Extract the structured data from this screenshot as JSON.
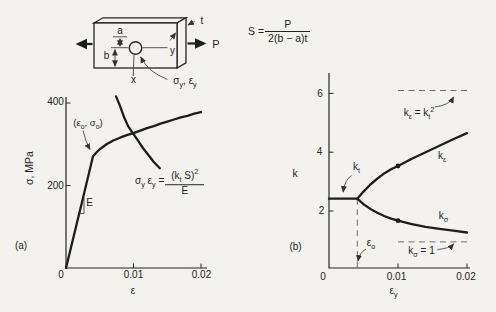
{
  "specimen": {
    "dim_a": "a",
    "dim_b": "b",
    "thickness": "t",
    "load": "P",
    "axis_x": "x",
    "axis_y": "y",
    "hole_stress": "σ_{y}, ε_{y}"
  },
  "equation": {
    "lhs": "S =",
    "numerator": "P",
    "denominator": "2(b − a)t"
  },
  "colors": {
    "background": "#f3f2ee",
    "ink": "#1d1d1d",
    "dashed_gray": "#6e6e6e"
  },
  "chart_data": [
    {
      "type": "line",
      "panel_label": "(a)",
      "xlabel": "ε",
      "ylabel": "σ, MPa",
      "xlim": [
        0,
        0.021
      ],
      "ylim": [
        0,
        430
      ],
      "x_ticks": [
        0,
        0.01,
        0.02
      ],
      "x_tick_labels": [
        "0",
        "0.01",
        "0.02"
      ],
      "y_ticks": [
        200,
        400
      ],
      "y_tick_labels": [
        "200",
        "400"
      ],
      "grid": false,
      "series": [
        {
          "name": "material stress-strain curve",
          "points": [
            [
              0,
              0
            ],
            [
              0.0013,
              88
            ],
            [
              0.0027,
              182
            ],
            [
              0.004,
              271
            ],
            [
              0.0045,
              280
            ],
            [
              0.005,
              288
            ],
            [
              0.006,
              300
            ],
            [
              0.007,
              309
            ],
            [
              0.008,
              316
            ],
            [
              0.009,
              322
            ],
            [
              0.01,
              327
            ],
            [
              0.011,
              333
            ],
            [
              0.012,
              339
            ],
            [
              0.013,
              344
            ],
            [
              0.014,
              350
            ],
            [
              0.015,
              355
            ],
            [
              0.016,
              360
            ],
            [
              0.017,
              365
            ],
            [
              0.018,
              369
            ],
            [
              0.019,
              374
            ],
            [
              0.02,
              378
            ]
          ]
        },
        {
          "name": "Neuber hyperbola",
          "points": [
            [
              0.0074,
              416
            ],
            [
              0.008,
              393
            ],
            [
              0.0086,
              366
            ],
            [
              0.0092,
              344
            ],
            [
              0.0099,
              327
            ],
            [
              0.0107,
              308
            ],
            [
              0.0114,
              291
            ],
            [
              0.0122,
              274
            ],
            [
              0.013,
              257
            ],
            [
              0.0139,
              242
            ]
          ]
        }
      ],
      "annotations": {
        "knee": "(ε_{o}, σ_{o})",
        "knee_point": [
          0.004,
          271
        ],
        "modulus": "E",
        "neuber_lhs": "σ_{y} ε_{y} =",
        "neuber_numerator": "(k_{t} S)^{2}",
        "neuber_denominator": "E"
      }
    },
    {
      "type": "line",
      "panel_label": "(b)",
      "xlabel": "ε_{y}",
      "ylabel": "k",
      "xlim": [
        0,
        0.021
      ],
      "ylim": [
        0,
        7
      ],
      "x_ticks": [
        0,
        0.01,
        0.02
      ],
      "x_tick_labels": [
        "0",
        "0.01",
        "0.02"
      ],
      "y_ticks": [
        2,
        4,
        6
      ],
      "y_tick_labels": [
        "2",
        "4",
        "6"
      ],
      "grid": false,
      "series": [
        {
          "name": "k_t constant line",
          "points": [
            [
              0,
              2.42
            ],
            [
              0.0041,
              2.42
            ]
          ]
        },
        {
          "name": "k_epsilon strain concentration",
          "marker_point": [
            0.01,
            3.53
          ],
          "points": [
            [
              0.0041,
              2.42
            ],
            [
              0.005,
              2.66
            ],
            [
              0.006,
              2.9
            ],
            [
              0.007,
              3.1
            ],
            [
              0.008,
              3.28
            ],
            [
              0.009,
              3.42
            ],
            [
              0.01,
              3.53
            ],
            [
              0.012,
              3.78
            ],
            [
              0.014,
              4.0
            ],
            [
              0.016,
              4.22
            ],
            [
              0.018,
              4.44
            ],
            [
              0.02,
              4.65
            ]
          ]
        },
        {
          "name": "k_sigma stress concentration",
          "marker_point": [
            0.01,
            1.67
          ],
          "points": [
            [
              0.0041,
              2.42
            ],
            [
              0.005,
              2.23
            ],
            [
              0.006,
              2.07
            ],
            [
              0.007,
              1.94
            ],
            [
              0.008,
              1.83
            ],
            [
              0.009,
              1.74
            ],
            [
              0.01,
              1.67
            ],
            [
              0.012,
              1.55
            ],
            [
              0.014,
              1.46
            ],
            [
              0.016,
              1.39
            ],
            [
              0.018,
              1.33
            ],
            [
              0.02,
              1.27
            ]
          ]
        }
      ],
      "reference_lines": [
        {
          "label": "k_{ε} = k_{t}^{2}",
          "k": 6.1,
          "x_range": [
            0.01,
            0.0202
          ]
        },
        {
          "label": "k_{σ} = 1",
          "k": 0.95,
          "x_range": [
            0.01,
            0.0202
          ]
        },
        {
          "label": "ε_{o}",
          "orientation": "vertical",
          "eps": 0.0041,
          "k_range": [
            0.06,
            2.42
          ]
        }
      ],
      "annotations": {
        "kt": "k_{t}",
        "ke": "k_{ε}",
        "ks": "k_{σ}"
      }
    }
  ]
}
